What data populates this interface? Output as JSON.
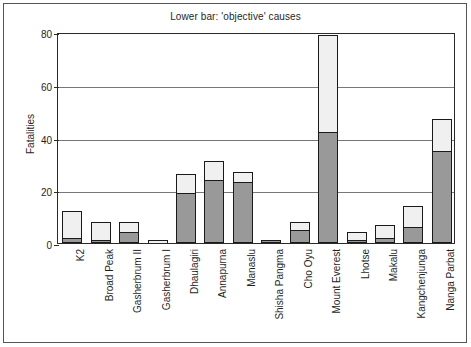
{
  "chart_data": {
    "type": "bar",
    "subtype": "stacked-bar",
    "title": "Lower bar: 'objective' causes",
    "xlabel": "",
    "ylabel": "Fatalities",
    "ylim": [
      0,
      80
    ],
    "yticks": [
      0,
      20,
      40,
      60,
      80
    ],
    "grid": "horizontal",
    "legend": "none",
    "categories": [
      "K2",
      "Broad Peak",
      "Gasherbrum II",
      "Gasherbrum I",
      "Dhaulagiri",
      "Annapurna",
      "Manaslu",
      "Shisha Pangma",
      "Cho Oyu",
      "Mount Everest",
      "Lhotse",
      "Makalu",
      "Kangchenjunga",
      "Nanga Parbat"
    ],
    "series": [
      {
        "name": "objective causes (lower bar)",
        "color": "#999999",
        "values": [
          2,
          1,
          4,
          0,
          19,
          24,
          23,
          1,
          5,
          42,
          1,
          2,
          6,
          35
        ]
      },
      {
        "name": "other causes (upper bar)",
        "color": "#f0f0f0",
        "values": [
          10,
          7,
          4,
          1,
          7,
          7,
          4,
          0,
          3,
          37,
          3,
          5,
          8,
          12
        ]
      }
    ],
    "totals": [
      12,
      8,
      8,
      1,
      26,
      31,
      27,
      1,
      8,
      79,
      4,
      7,
      14,
      47
    ]
  },
  "figure": {
    "frame_color": "#555555",
    "axis_color": "#2a2a2a",
    "gridline_color": "#777777",
    "background": "#ffffff"
  }
}
